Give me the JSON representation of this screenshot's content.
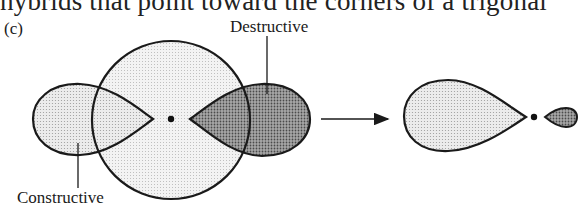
{
  "text": {
    "cutoff_line": "hybrids that point toward the corners of a trigonal",
    "panel_label": "(c)",
    "label_destructive": "Destructive",
    "label_constructive": "Constructive"
  },
  "diagram": {
    "colors": {
      "stroke": "#1a1a1a",
      "light_fill": "#d9d9d9",
      "circle_fill": "#e6e6e6",
      "dark_fill": "#8a8a8a"
    },
    "left_panel": {
      "s_orbital": {
        "cx": 171,
        "cy": 120,
        "r": 79
      },
      "nucleus": {
        "cx": 171,
        "cy": 119
      },
      "p_lobe_left": {
        "phase": "positive",
        "overlap": "Constructive"
      },
      "p_lobe_right": {
        "phase": "negative",
        "overlap": "Destructive"
      }
    },
    "arrow": {
      "x1": 321,
      "x2": 388,
      "y": 119
    },
    "right_panel": {
      "nucleus": {
        "cx": 534,
        "cy": 117
      },
      "large_lobe": {
        "phase": "positive"
      },
      "small_lobe": {
        "phase": "negative"
      }
    }
  }
}
